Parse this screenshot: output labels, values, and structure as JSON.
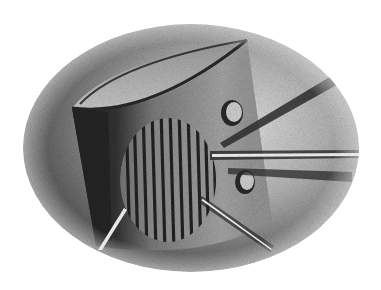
{
  "image": {
    "description": "Grayscale stippled pencil illustration in an oval vignette: a curved-top cylindrical speaker-like object with striped grille, two round holes, and light beams radiating outward",
    "width": 381,
    "height": 290
  },
  "colors": {
    "background": "#ffffff",
    "oval_dark": "#5a5a5a",
    "oval_light": "#d8d8d8",
    "body_shadow": "#2e2e2e",
    "body_mid": "#8a8a8a",
    "body_light": "#b8b8b8",
    "stripe": "#262626",
    "beam_light": "#f4f4f4",
    "beam_edge": "#303030"
  },
  "shapes": {
    "oval": {
      "cx": 191,
      "cy": 148,
      "rx": 168,
      "ry": 124
    },
    "holes": [
      {
        "cx": 232,
        "cy": 113,
        "rx": 10,
        "ry": 12
      },
      {
        "cx": 246,
        "cy": 182,
        "rx": 9,
        "ry": 11
      }
    ],
    "stripe_count": 11
  }
}
